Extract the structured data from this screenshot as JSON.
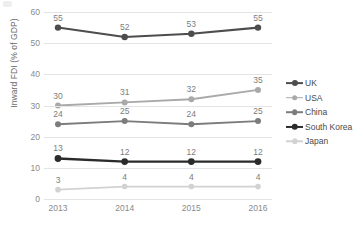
{
  "chart_data": {
    "type": "line",
    "title": "",
    "xlabel": "",
    "ylabel": "Inward FDI (% of GDP)",
    "categories": [
      "2013",
      "2014",
      "2015",
      "2016"
    ],
    "x": [
      2013,
      2014,
      2015,
      2016
    ],
    "ylim": [
      0,
      60
    ],
    "yticks": [
      0,
      10,
      20,
      30,
      40,
      50,
      60
    ],
    "ytick_labels": [
      "0",
      "10",
      "20",
      "30",
      "40",
      "50",
      "60"
    ],
    "grid": true,
    "legend_position": "right",
    "data_labels": true,
    "series": [
      {
        "name": "UK",
        "values": [
          55,
          52,
          53,
          55
        ],
        "labels": [
          "55",
          "52",
          "53",
          "55"
        ],
        "color": "#4d4d4d",
        "line_width": 2.1,
        "marker_size": 3.2
      },
      {
        "name": "USA",
        "values": [
          30,
          31,
          32,
          35
        ],
        "labels": [
          "30",
          "31",
          "32",
          "35"
        ],
        "color": "#a9a9a9",
        "line_width": 1.9,
        "marker_size": 3.0
      },
      {
        "name": "China",
        "values": [
          24,
          25,
          24,
          25
        ],
        "labels": [
          "24",
          "25",
          "24",
          "25"
        ],
        "color": "#7c7c7c",
        "line_width": 1.9,
        "marker_size": 3.0
      },
      {
        "name": "South Korea",
        "values": [
          13,
          12,
          12,
          12
        ],
        "labels": [
          "13",
          "12",
          "12",
          "12"
        ],
        "color": "#2b2b2b",
        "line_width": 2.4,
        "marker_size": 3.4
      },
      {
        "name": "Japan",
        "values": [
          3,
          4,
          4,
          4
        ],
        "labels": [
          "3",
          "4",
          "4",
          "4"
        ],
        "color": "#d2d2d2",
        "line_width": 1.7,
        "marker_size": 2.8
      }
    ]
  },
  "legend": {
    "items": [
      {
        "label": "UK"
      },
      {
        "label": "USA"
      },
      {
        "label": "China"
      },
      {
        "label": "South Korea"
      },
      {
        "label": "Japan"
      }
    ]
  },
  "colors": {
    "gridline": "#e4e4e4",
    "tick_text": "#8a8a8a",
    "axis_title": "#6b6b6b",
    "data_label": "#7d7d7d",
    "legend_text": "#4a4a4a",
    "background": "#ffffff"
  }
}
